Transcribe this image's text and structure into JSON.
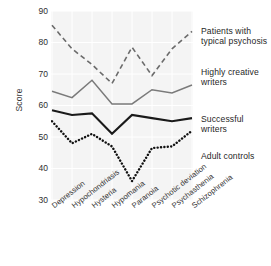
{
  "chart_data": {
    "type": "line",
    "title": "",
    "xlabel": "",
    "ylabel": "Score",
    "ylim": [
      30,
      90
    ],
    "yticks": [
      90,
      80,
      70,
      60,
      50,
      40,
      30
    ],
    "grid": true,
    "legend_position": "right",
    "categories": [
      "Depression",
      "Hypochondriasis",
      "Hysteria",
      "Hypomania",
      "Paranoia",
      "Psychotic deviation",
      "Psychasthenia",
      "Schizophrenia"
    ],
    "series": [
      {
        "name": "Patients with typical psychosis",
        "style": "dashed",
        "color": "#6b6b6b",
        "values": [
          85.5,
          78.0,
          73.0,
          67.0,
          78.5,
          69.5,
          78.0,
          83.5
        ]
      },
      {
        "name": "Highly creative writers",
        "style": "solid",
        "color": "#7a7a7a",
        "values": [
          64.5,
          62.5,
          68.0,
          60.5,
          60.5,
          65.0,
          64.0,
          66.5
        ]
      },
      {
        "name": "Successful writers",
        "style": "solid",
        "color": "#1a1a1a",
        "values": [
          58.5,
          57.0,
          57.5,
          51.0,
          57.0,
          56.0,
          55.0,
          56.0
        ]
      },
      {
        "name": "Adult controls",
        "style": "dotted",
        "color": "#111111",
        "values": [
          55.0,
          48.0,
          51.0,
          47.0,
          36.0,
          46.5,
          47.0,
          52.0
        ]
      }
    ]
  },
  "legend": {
    "entries": [
      {
        "label": "Patients with typical psychosis",
        "top": 26
      },
      {
        "label": "Highly creative writers",
        "top": 67
      },
      {
        "label": "Successful writers",
        "top": 114
      },
      {
        "label": "Adult controls",
        "top": 151
      }
    ]
  }
}
